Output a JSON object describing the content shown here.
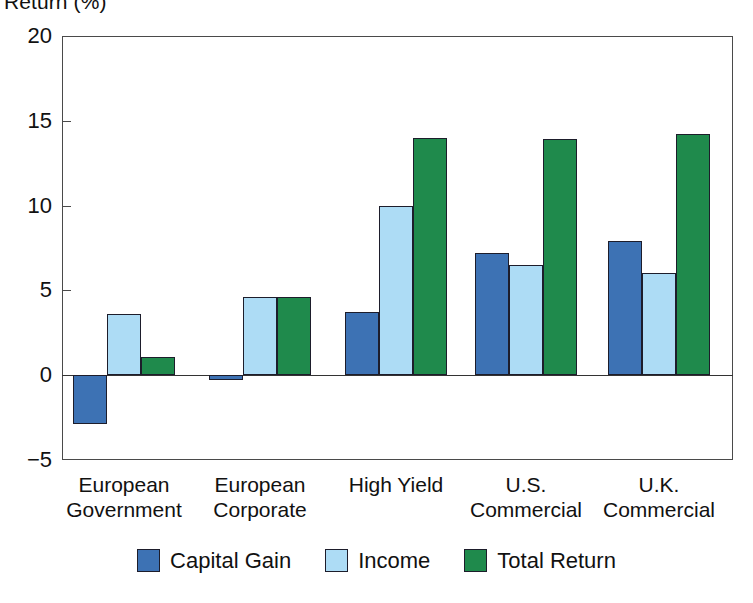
{
  "chart_data": {
    "type": "bar",
    "title": "Return (%)",
    "xlabel": "",
    "ylabel": "Return (%)",
    "ylim": [
      -5,
      20
    ],
    "yticks": [
      20,
      15,
      10,
      5,
      0,
      -5
    ],
    "ytick_labels": [
      "20",
      "15",
      "10",
      "5",
      "0",
      "−5"
    ],
    "grid": false,
    "legend_position": "bottom",
    "categories": [
      "European Government",
      "European Corporate",
      "High Yield",
      "U.S. Commercial",
      "U.K. Commercial"
    ],
    "category_lines": [
      [
        "European",
        "Government"
      ],
      [
        "European",
        "Corporate"
      ],
      [
        "High Yield",
        ""
      ],
      [
        "U.S.",
        "Commercial"
      ],
      [
        "U.K.",
        "Commercial"
      ]
    ],
    "series": [
      {
        "name": "Capital Gain",
        "color": "#3d72b4",
        "values": [
          -2.9,
          -0.3,
          3.7,
          7.2,
          7.9
        ]
      },
      {
        "name": "Income",
        "color": "#addcf5",
        "values": [
          3.6,
          4.6,
          10.0,
          6.5,
          6.0
        ]
      },
      {
        "name": "Total Return",
        "color": "#1f8a4c",
        "values": [
          1.1,
          4.6,
          14.0,
          13.9,
          14.2
        ]
      }
    ]
  },
  "colors": {
    "capital_gain": "#3d72b4",
    "income": "#addcf5",
    "total_return": "#1f8a4c",
    "bar_outline": "#1d1d2b",
    "axis": "#4a4a4a",
    "background": "#ffffff"
  }
}
